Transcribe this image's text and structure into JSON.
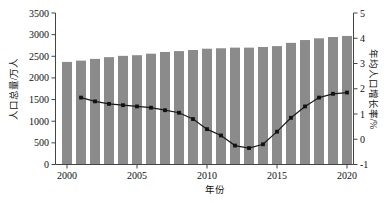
{
  "figure": {
    "background": "#ffffff",
    "bar_color": "#8b8b8b",
    "line_color": "#1a1a1a",
    "marker_color": "#111111",
    "axis_color": "#444444",
    "tick_font_size": 10
  },
  "chart_data": {
    "type": "bar+line",
    "title": "",
    "xlabel": "年份",
    "ylabel_left": "人口总量/万人",
    "ylabel_right": "年均人口增长率/%",
    "x_axis": {
      "min": 2000,
      "max": 2020,
      "tick_labels": [
        2000,
        2005,
        2010,
        2015,
        2020
      ]
    },
    "left_axis": {
      "min": 0,
      "max": 3500,
      "ticks": [
        0,
        500,
        1000,
        1500,
        2000,
        2500,
        3000,
        3500
      ]
    },
    "right_axis": {
      "min": -1,
      "max": 5,
      "ticks": [
        -1,
        0,
        1,
        2,
        3,
        4,
        5
      ]
    },
    "categories": [
      2000,
      2001,
      2002,
      2003,
      2004,
      2005,
      2006,
      2007,
      2008,
      2009,
      2010,
      2011,
      2012,
      2013,
      2014,
      2015,
      2016,
      2017,
      2018,
      2019,
      2020
    ],
    "series": [
      {
        "name": "人口总量",
        "type": "bar",
        "axis": "left",
        "values": [
          2370,
          2400,
          2440,
          2480,
          2510,
          2525,
          2560,
          2600,
          2620,
          2645,
          2675,
          2685,
          2700,
          2700,
          2715,
          2735,
          2810,
          2875,
          2915,
          2945,
          2970
        ]
      },
      {
        "name": "年均人口增长率",
        "type": "line",
        "axis": "right",
        "values": [
          null,
          1.65,
          1.5,
          1.4,
          1.35,
          1.3,
          1.25,
          1.15,
          1.05,
          0.8,
          0.4,
          0.15,
          -0.25,
          -0.35,
          -0.2,
          0.3,
          0.85,
          1.3,
          1.65,
          1.8,
          1.85
        ]
      }
    ]
  }
}
